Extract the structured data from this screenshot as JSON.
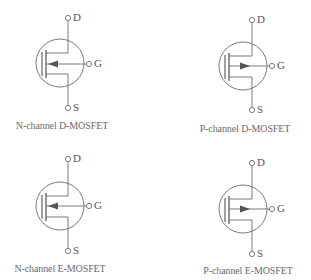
{
  "colors": {
    "line": "#7a7a7a",
    "arrow": "#555555",
    "text": "#6a6a6a",
    "background": "#ffffff"
  },
  "symbols": [
    {
      "id": "n-channel-d-mosfet",
      "caption": "N-channel D-MOSFET",
      "channel_type": "N",
      "mode": "depletion",
      "arrow_direction": "inward",
      "terminals": {
        "drain": "D",
        "gate": "G",
        "source": "S"
      }
    },
    {
      "id": "p-channel-d-mosfet",
      "caption": "P-channel D-MOSFET",
      "channel_type": "P",
      "mode": "depletion",
      "arrow_direction": "outward",
      "terminals": {
        "drain": "D",
        "gate": "G",
        "source": "S"
      }
    },
    {
      "id": "n-channel-e-mosfet",
      "caption": "N-channel E-MOSFET",
      "channel_type": "N",
      "mode": "enhancement",
      "arrow_direction": "inward",
      "terminals": {
        "drain": "D",
        "gate": "G",
        "source": "S"
      }
    },
    {
      "id": "p-channel-e-mosfet",
      "caption": "P-channel E-MOSFET",
      "channel_type": "P",
      "mode": "enhancement",
      "arrow_direction": "outward",
      "terminals": {
        "drain": "D",
        "gate": "G",
        "source": "S"
      }
    }
  ]
}
